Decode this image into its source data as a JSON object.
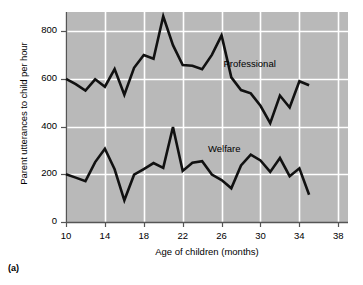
{
  "figure": {
    "caption": "(a)",
    "plot_background_color": "#b9b9b9",
    "line_color": "#111111",
    "gridline_color": "#ffffff",
    "axis_color": "#555555"
  },
  "chart_data": {
    "type": "line",
    "title": "",
    "xlabel": "Age of children (months)",
    "ylabel": "Parent utterances to child per hour",
    "xlim": [
      10,
      39
    ],
    "ylim": [
      0,
      880
    ],
    "xticks": [
      10,
      14,
      18,
      22,
      26,
      30,
      34,
      38
    ],
    "yticks": [
      0,
      200,
      400,
      600,
      800
    ],
    "xtick_labels": [
      "10",
      "14",
      "18",
      "22",
      "26",
      "30",
      "34",
      "38"
    ],
    "ytick_labels": [
      "0",
      "200",
      "400",
      "600",
      "800"
    ],
    "grid": true,
    "grid_orientation": "both",
    "legend": "inline-annotations",
    "annotations": [
      {
        "text": "Professional",
        "x": 26.2,
        "y": 660
      },
      {
        "text": "Welfare",
        "x": 24.6,
        "y": 300
      }
    ],
    "series": [
      {
        "name": "Professional",
        "color": "#111111",
        "x": [
          10,
          11,
          12,
          13,
          14,
          15,
          16,
          17,
          18,
          19,
          20,
          21,
          22,
          23,
          24,
          25,
          26,
          27,
          28,
          29,
          30,
          31,
          32,
          33,
          34,
          35
        ],
        "values": [
          600,
          578,
          551,
          598,
          567,
          641,
          533,
          646,
          700,
          684,
          862,
          741,
          658,
          655,
          640,
          700,
          782,
          606,
          553,
          539,
          487,
          414,
          530,
          480,
          590,
          573
        ]
      },
      {
        "name": "Welfare",
        "color": "#111111",
        "x": [
          10,
          11,
          12,
          13,
          14,
          15,
          16,
          17,
          18,
          19,
          20,
          21,
          22,
          23,
          24,
          25,
          26,
          27,
          28,
          29,
          30,
          31,
          32,
          33,
          34,
          35
        ],
        "values": [
          200,
          186,
          171,
          251,
          307,
          221,
          91,
          198,
          222,
          247,
          227,
          398,
          214,
          248,
          255,
          199,
          176,
          141,
          237,
          282,
          258,
          210,
          268,
          192,
          225,
          114
        ]
      }
    ]
  }
}
